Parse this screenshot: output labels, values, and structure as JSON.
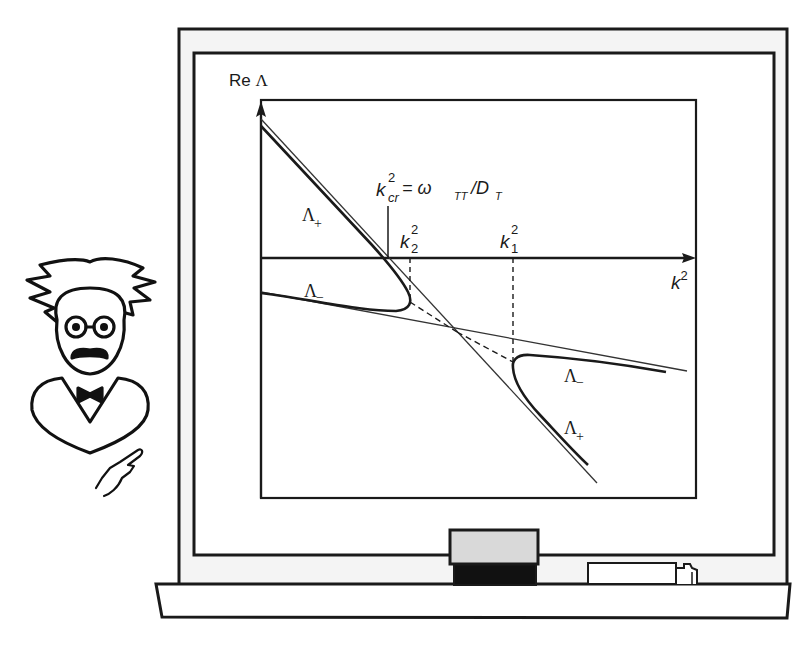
{
  "scene": {
    "description": "Cartoon professor pointing at a chalkboard showing a dispersion diagram",
    "colors": {
      "ink": "#1a1a1a",
      "board_fill": "#ffffff",
      "frame_fill": "#f4f4f4",
      "eraser_top": "#d9d9d9",
      "eraser_bottom": "#111111"
    }
  },
  "diagram": {
    "y_axis_label_prefix": "Re ",
    "y_axis_label_symbol": "Λ",
    "x_axis_label_base": "k",
    "x_axis_label_sup": "2",
    "critical_label": {
      "base": "k",
      "sup": "2",
      "sub": "cr",
      "equals": " = ω",
      "omega_sub": "TT",
      "slash": "/D",
      "d_sub": "T"
    },
    "k2_label": {
      "base": "k",
      "sup": "2",
      "sub": "2"
    },
    "k1_label": {
      "base": "k",
      "sup": "2",
      "sub": "1"
    },
    "branch_labels": {
      "upper_left_plus": {
        "base": "Λ",
        "sub": "+"
      },
      "left_minus": {
        "base": "Λ",
        "sub": "−"
      },
      "right_minus": {
        "base": "Λ",
        "sub": "−"
      },
      "lower_right_plus": {
        "base": "Λ",
        "sub": "+"
      }
    }
  },
  "icons": {
    "professor": "professor-icon",
    "eraser": "eraser-icon",
    "chalk": "chalk-icon"
  }
}
